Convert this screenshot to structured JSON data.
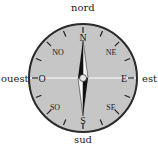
{
  "compass": {
    "outer_labels": {
      "north": "nord",
      "south": "sud",
      "west": "ouest",
      "east": "est"
    },
    "dial_labels": {
      "N": "N",
      "S": "S",
      "E": "E",
      "W": "O",
      "NE": "NE",
      "NW": "NO",
      "SE": "SE",
      "SW": "SO"
    },
    "colors": {
      "dial_fill": "#c6c6c6",
      "rim": "#2a2a2a",
      "needle_dark": "#111111",
      "needle_light": "#f4f4f4",
      "axis_line": "#ffffff"
    }
  }
}
